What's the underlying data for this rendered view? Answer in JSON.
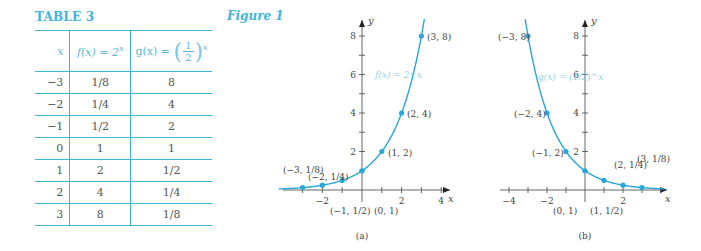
{
  "table": {
    "title": "TABLE 3",
    "headers": {
      "x": "x",
      "f_label": "f(x) = 2",
      "f_exp": "x",
      "g_label": "g(x) =",
      "g_num": "1",
      "g_den": "2",
      "g_exp": "x"
    },
    "rows": [
      {
        "x": "−3",
        "f": "1/8",
        "g": "8"
      },
      {
        "x": "−2",
        "f": "1/4",
        "g": "4"
      },
      {
        "x": "−1",
        "f": "1/2",
        "g": "2"
      },
      {
        "x": "0",
        "f": "1",
        "g": "1"
      },
      {
        "x": "1",
        "f": "2",
        "g": "1/2"
      },
      {
        "x": "2",
        "f": "4",
        "g": "1/4"
      },
      {
        "x": "3",
        "f": "8",
        "g": "1/8"
      }
    ]
  },
  "figure": {
    "title": "Figure 1"
  },
  "chart_data": [
    {
      "type": "line",
      "title": "(a)",
      "function_label": "f(x) = 2^x",
      "xlabel": "x",
      "ylabel": "y",
      "xlim": [
        -4.3,
        4.8
      ],
      "ylim": [
        0,
        9
      ],
      "x_ticks": [
        -3,
        -2,
        -1,
        0,
        1,
        2,
        3,
        4
      ],
      "x_tick_labels": [
        "-2",
        "2",
        "4"
      ],
      "y_ticks": [
        2,
        4,
        6,
        8
      ],
      "y_tick_labels": [
        "2",
        "4",
        "6",
        "8"
      ],
      "grid": false,
      "series": [
        {
          "name": "f(x) = 2^x",
          "x": [
            -3,
            -2,
            -1,
            0,
            1,
            2,
            3
          ],
          "y": [
            0.125,
            0.25,
            0.5,
            1,
            2,
            4,
            8
          ]
        }
      ],
      "annotations": [
        "(-3, 1/8)",
        "(-2, 1/4)",
        "(-1, 1/2)",
        "(0, 1)",
        "(1, 2)",
        "(2, 4)",
        "(3, 8)"
      ]
    },
    {
      "type": "line",
      "title": "(b)",
      "function_label": "g(x) = (1/2)^x",
      "xlabel": "x",
      "ylabel": "y",
      "xlim": [
        -4.5,
        4.3
      ],
      "ylim": [
        0,
        9
      ],
      "x_ticks": [
        -4,
        -3,
        -2,
        -1,
        0,
        1,
        2,
        3,
        4
      ],
      "x_tick_labels": [
        "-4",
        "-2",
        "2"
      ],
      "y_ticks": [
        2,
        4,
        6,
        8
      ],
      "y_tick_labels": [
        "2",
        "4",
        "6",
        "8"
      ],
      "grid": false,
      "series": [
        {
          "name": "g(x) = (1/2)^x",
          "x": [
            -3,
            -2,
            -1,
            0,
            1,
            2,
            3
          ],
          "y": [
            8,
            4,
            2,
            1,
            0.5,
            0.25,
            0.125
          ]
        }
      ],
      "annotations": [
        "(-3, 8)",
        "(-2, 4)",
        "(-1, 2)",
        "(0, 1)",
        "(1, 1/2)",
        "(2, 1/4)",
        "(3, 1/8)"
      ]
    }
  ],
  "colors": {
    "accent": "#3cb5dc",
    "curve": "#29a8d8",
    "axis": "#555555",
    "label": "#444444",
    "fn_label": "#8fd3ea"
  }
}
